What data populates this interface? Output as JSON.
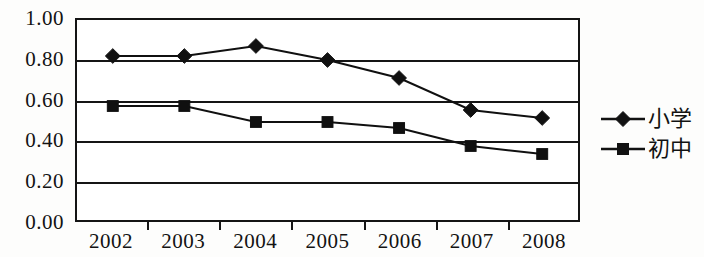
{
  "chart_data": {
    "type": "line",
    "title": "",
    "subtitle": "",
    "xlabel": "",
    "ylabel": "",
    "categories": [
      "2002",
      "2003",
      "2004",
      "2005",
      "2006",
      "2007",
      "2008"
    ],
    "ylim": [
      0.0,
      1.0
    ],
    "ytick_values": [
      0.0,
      0.2,
      0.4,
      0.6,
      0.8,
      1.0
    ],
    "ytick_labels": [
      "0.00",
      "0.20",
      "0.40",
      "0.60",
      "0.80",
      "1.00"
    ],
    "grid": true,
    "grid_axis": "y",
    "legend_position": "right",
    "series": [
      {
        "name": "小学",
        "marker": "diamond",
        "color": "#101010",
        "values": [
          0.82,
          0.82,
          0.87,
          0.8,
          0.71,
          0.55,
          0.51
        ]
      },
      {
        "name": "初中",
        "marker": "square",
        "color": "#101010",
        "values": [
          0.57,
          0.57,
          0.49,
          0.49,
          0.46,
          0.37,
          0.33
        ]
      }
    ]
  },
  "legend": {
    "items": [
      {
        "label": "小学",
        "marker": "diamond"
      },
      {
        "label": "初中",
        "marker": "square"
      }
    ]
  },
  "colors": {
    "ink": "#121212",
    "plot_background": "#ffffff",
    "page_background": "#fdfdfc"
  }
}
